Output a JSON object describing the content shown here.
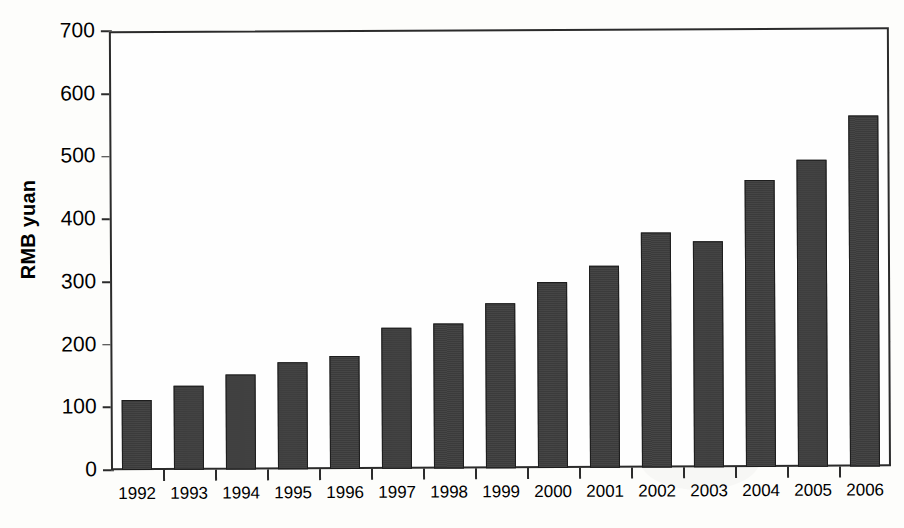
{
  "chart_data": {
    "type": "bar",
    "title": "",
    "subtitle": "",
    "xlabel": "",
    "ylabel": "RMB yuan",
    "categories": [
      "1992",
      "1993",
      "1994",
      "1995",
      "1996",
      "1997",
      "1998",
      "1999",
      "2000",
      "2001",
      "2002",
      "2003",
      "2004",
      "2005",
      "2006"
    ],
    "values": [
      112,
      134,
      152,
      171,
      180,
      225,
      231,
      263,
      297,
      322,
      374,
      361,
      458,
      490,
      559
    ],
    "ylim": [
      0,
      700
    ],
    "ytick_labels": [
      "0",
      "100",
      "200",
      "300",
      "400",
      "500",
      "600",
      "700"
    ],
    "ytick_values": [
      0,
      100,
      200,
      300,
      400,
      500,
      600,
      700
    ],
    "grid": true,
    "legend": false,
    "legend_position": "none",
    "series": [
      {
        "name": "RMB yuan",
        "color": "#3b3b3b",
        "values": [
          112,
          134,
          152,
          171,
          180,
          225,
          231,
          263,
          297,
          322,
          374,
          361,
          458,
          490,
          559
        ]
      }
    ],
    "annotations": []
  },
  "style": {
    "bar_color": "#3b3b3b",
    "bar_outline_color": "#1d1d1d",
    "axis_color": "#2b2b2b",
    "gridline_color": "#9a9a9a",
    "background_color": "#fdfdfb"
  }
}
